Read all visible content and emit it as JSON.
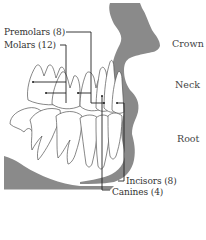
{
  "diagram": {
    "title": "",
    "labels": {
      "premolars": "Premolars (8)",
      "molars": "Molars (12)",
      "incisors": "Incisors (8)",
      "canines": "Canines (4)"
    },
    "regions": {
      "crown": "Crown",
      "neck": "Neck",
      "root": "Root"
    },
    "colors": {
      "soft_tissue": "#8a8a8a",
      "outline": "#555555",
      "leader_line": "#222222",
      "text": "#333333",
      "background": "#ffffff"
    }
  }
}
